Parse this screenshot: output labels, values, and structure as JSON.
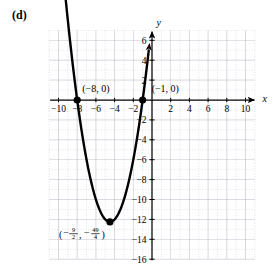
{
  "panel": {
    "label": "(d)"
  },
  "chart_data": {
    "type": "line",
    "title": "",
    "subtitle": "",
    "xlabel": "x",
    "ylabel": "y",
    "xlim": [
      -11,
      11
    ],
    "ylim": [
      -16,
      7
    ],
    "grid": true,
    "grid_step": 2,
    "legend": "none",
    "curve": {
      "name": "parabola",
      "equation": "y = (x + 8)(x + 1)",
      "expanded": "y = x^2 + 9x + 8",
      "opens": "up",
      "color": "#000000",
      "x_start": -9.45,
      "x_end": -0.35,
      "arrows": [
        "start",
        "end"
      ]
    },
    "points": [
      {
        "name": "x-intercept-left",
        "x": -8,
        "y": 0,
        "label": "(−8, 0)"
      },
      {
        "name": "x-intercept-right",
        "x": -1,
        "y": 0,
        "label": "(−1, 0)"
      },
      {
        "name": "vertex",
        "x": -4.5,
        "y": -12.25,
        "label_x_num": "9",
        "label_x_den": "2",
        "label_y_num": "49",
        "label_y_den": "4"
      }
    ],
    "xticks": [
      {
        "value": -10,
        "label": "−10"
      },
      {
        "value": -8,
        "label": "−8"
      },
      {
        "value": -6,
        "label": "−6"
      },
      {
        "value": -4,
        "label": "−4"
      },
      {
        "value": -2,
        "label": "−2"
      },
      {
        "value": 2,
        "label": "2"
      },
      {
        "value": 4,
        "label": "4"
      },
      {
        "value": 6,
        "label": "6"
      },
      {
        "value": 8,
        "label": "8"
      },
      {
        "value": 10,
        "label": "10"
      }
    ],
    "yticks": [
      {
        "value": 6,
        "label": "6"
      },
      {
        "value": 4,
        "label": "4"
      },
      {
        "value": 2,
        "label": "2"
      },
      {
        "value": -2,
        "label": "−2"
      },
      {
        "value": -4,
        "label": "−4"
      },
      {
        "value": -6,
        "label": "−6"
      },
      {
        "value": -8,
        "label": "−8"
      },
      {
        "value": -10,
        "label": "−10"
      },
      {
        "value": -12,
        "label": "−12"
      },
      {
        "value": -14,
        "label": "−14"
      },
      {
        "value": -16,
        "label": "−16"
      }
    ],
    "colors": {
      "curve": "#000000",
      "axis": "#000000",
      "grid": "#b9b9c9",
      "background": "#ffffff"
    }
  }
}
